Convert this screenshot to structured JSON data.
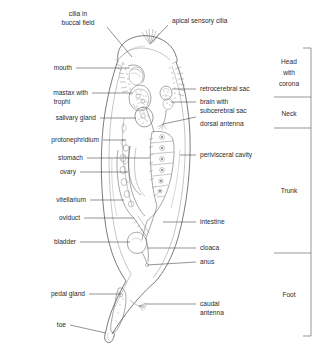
{
  "figure": {
    "background_color": "#ffffff",
    "line_color": "#5d5d5d",
    "text_color": "#2b2b2b"
  },
  "labels_left": [
    {
      "id": "cilia-in-buccal-field",
      "line1": "cilia in",
      "line2": "buccal field"
    },
    {
      "id": "mouth",
      "line1": "mouth",
      "line2": ""
    },
    {
      "id": "mastax-with-trophi",
      "line1": "mastax with",
      "line2": "trophi"
    },
    {
      "id": "salivary-gland",
      "line1": "salivary gland",
      "line2": ""
    },
    {
      "id": "protonephridium",
      "line1": "protonephridium",
      "line2": ""
    },
    {
      "id": "stomach",
      "line1": "stomach",
      "line2": ""
    },
    {
      "id": "ovary",
      "line1": "ovary",
      "line2": ""
    },
    {
      "id": "vitellarium",
      "line1": "vitellarium",
      "line2": ""
    },
    {
      "id": "oviduct",
      "line1": "oviduct",
      "line2": ""
    },
    {
      "id": "bladder",
      "line1": "bladder",
      "line2": ""
    },
    {
      "id": "pedal-gland",
      "line1": "pedal gland",
      "line2": ""
    },
    {
      "id": "toe",
      "line1": "toe",
      "line2": ""
    }
  ],
  "labels_right": [
    {
      "id": "apical-sensory-cilia",
      "line1": "apical sensory cilia",
      "line2": ""
    },
    {
      "id": "retrocerebral-sac",
      "line1": "retrocerebral sac",
      "line2": ""
    },
    {
      "id": "brain-with-subcerebral-sac",
      "line1": "brain with",
      "line2": "subcerebral sac"
    },
    {
      "id": "dorsal-antenna",
      "line1": "dorsal antenna",
      "line2": ""
    },
    {
      "id": "perivisceral-cavity",
      "line1": "perivisceral cavity",
      "line2": ""
    },
    {
      "id": "intestine",
      "line1": "intestine",
      "line2": ""
    },
    {
      "id": "cloaca",
      "line1": "cloaca",
      "line2": ""
    },
    {
      "id": "anus",
      "line1": "anus",
      "line2": ""
    },
    {
      "id": "caudal-antenna",
      "line1": "caudal",
      "line2": "antenna"
    }
  ],
  "body_regions": [
    {
      "id": "head-with-corona",
      "line1": "Head",
      "line2": "with",
      "line3": "corona"
    },
    {
      "id": "neck",
      "line1": "Neck",
      "line2": "",
      "line3": ""
    },
    {
      "id": "trunk",
      "line1": "Trunk",
      "line2": "",
      "line3": ""
    },
    {
      "id": "foot",
      "line1": "Foot",
      "line2": "",
      "line3": ""
    }
  ]
}
